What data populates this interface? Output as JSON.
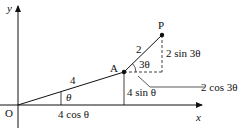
{
  "diagram": {
    "axes": {
      "x_label": "x",
      "y_label": "y",
      "origin_label": "O"
    },
    "points": {
      "A": "A",
      "P": "P"
    },
    "segments": {
      "OA_length": "4",
      "AP_length": "2"
    },
    "angles": {
      "theta": "θ",
      "three_theta": "3θ"
    },
    "measures": {
      "horizontal_OA": "4 cos θ",
      "vertical_OA": "4 sin θ",
      "vertical_AP": "2 sin 3θ",
      "horizontal_AP": "2 cos 3θ"
    },
    "colors": {
      "ink": "#111111",
      "background": "#ffffff"
    }
  }
}
